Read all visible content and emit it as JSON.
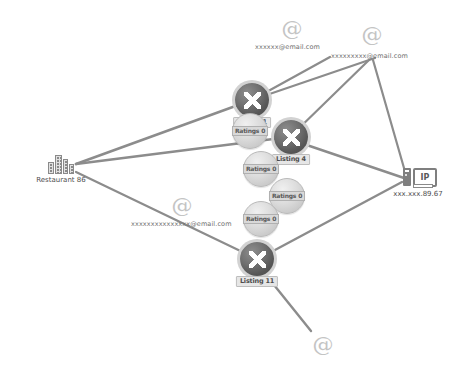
{
  "diagram": {
    "background": "#ffffff",
    "edge_color": "#8c8c8c",
    "node_dark_color": "#565656",
    "node_light_color": "#dcdcdc",
    "label_text_color": "#4d4d4d"
  },
  "entities": {
    "restaurant": {
      "label": "Restaurant 86",
      "icon": "building-icon"
    },
    "ip": {
      "label": "xxx.xxx.89.67",
      "icon": "ip-server-icon",
      "badge": "IP"
    }
  },
  "listings": [
    {
      "id": "listing-1",
      "label": "Listing 1",
      "icon": "x-mark-icon"
    },
    {
      "id": "listing-4",
      "label": "Listing 4",
      "icon": "x-mark-icon"
    },
    {
      "id": "listing-11",
      "label": "Listing 11",
      "icon": "x-mark-icon"
    }
  ],
  "ratings": [
    {
      "id": "ratings-a",
      "label": "Ratings 0"
    },
    {
      "id": "ratings-b",
      "label": "Ratings 0"
    },
    {
      "id": "ratings-c",
      "label": "Ratings 0"
    },
    {
      "id": "ratings-d",
      "label": "Ratings 0"
    }
  ],
  "emails": [
    {
      "id": "email-1",
      "label": "xxxxxx@email.com",
      "icon": "at-sign-icon"
    },
    {
      "id": "email-2",
      "label": "xxxxxxxxx@email.com",
      "icon": "at-sign-icon"
    },
    {
      "id": "email-3",
      "label": "xxxxxxxxxxxxxxx@email.com",
      "icon": "at-sign-icon"
    },
    {
      "id": "email-4",
      "label": "",
      "icon": "at-sign-icon"
    }
  ]
}
